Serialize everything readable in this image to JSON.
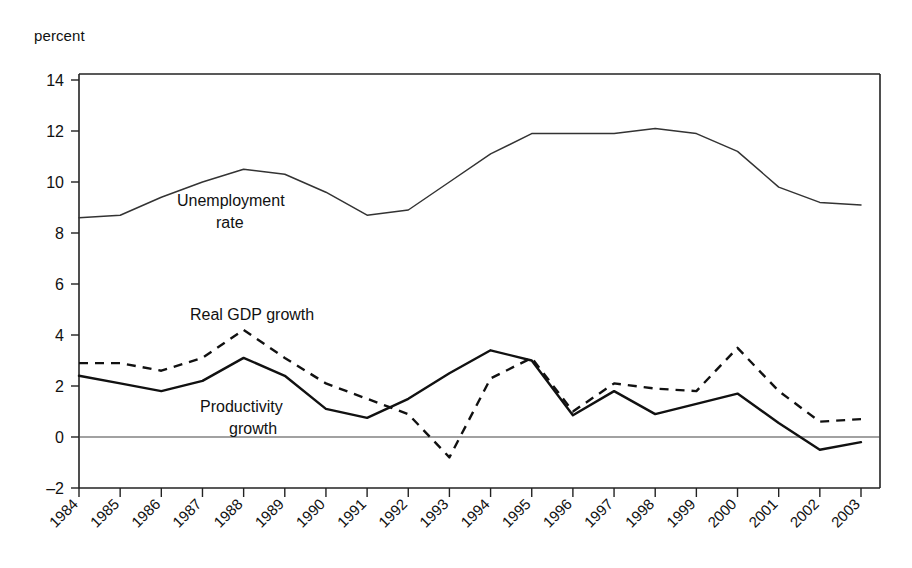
{
  "axis_unit_label": "percent",
  "labels": {
    "unemployment_line1": "Unemployment",
    "unemployment_line2": "rate",
    "gdp": "Real GDP growth",
    "productivity_line1": "Productivity",
    "productivity_line2": "growth"
  },
  "chart_data": {
    "type": "line",
    "title": "",
    "xlabel": "",
    "ylabel": "percent",
    "ylim": [
      -2,
      14
    ],
    "yticks": [
      -2,
      0,
      2,
      4,
      6,
      8,
      10,
      12,
      14
    ],
    "grid": false,
    "legend": "inline-annotations",
    "categories": [
      "1984",
      "1985",
      "1986",
      "1987",
      "1988",
      "1989",
      "1990",
      "1991",
      "1992",
      "1993",
      "1994",
      "1995",
      "1996",
      "1997",
      "1998",
      "1999",
      "2000",
      "2001",
      "2002",
      "2003"
    ],
    "series": [
      {
        "name": "Unemployment rate",
        "style": "thin-solid",
        "values": [
          8.6,
          8.7,
          9.4,
          10.0,
          10.5,
          10.3,
          9.6,
          8.7,
          8.9,
          10.0,
          11.1,
          11.9,
          11.9,
          11.9,
          12.1,
          11.9,
          11.2,
          9.8,
          9.2,
          9.1
        ]
      },
      {
        "name": "Real GDP growth",
        "style": "dashed",
        "values": [
          2.9,
          2.9,
          2.6,
          3.1,
          4.2,
          3.1,
          2.1,
          1.5,
          0.9,
          -0.8,
          2.3,
          3.1,
          1.0,
          2.1,
          1.9,
          1.8,
          3.5,
          1.8,
          0.6,
          0.7
        ]
      },
      {
        "name": "Productivity growth",
        "style": "solid",
        "values": [
          2.4,
          2.1,
          1.8,
          2.2,
          3.1,
          2.4,
          1.1,
          0.75,
          1.5,
          2.5,
          3.4,
          3.0,
          0.85,
          1.8,
          0.9,
          1.3,
          1.7,
          0.55,
          -0.5,
          -0.2
        ]
      }
    ]
  }
}
